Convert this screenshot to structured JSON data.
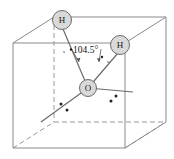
{
  "figure": {
    "colors": {
      "atom_fill": "#d9d9d9",
      "atom_stroke": "#6b6b6b",
      "bond": "#6b6b6b",
      "cube_solid": "#8a8a8a",
      "cube_dashed": "#9a9a9a",
      "dot": "#222222",
      "background": "#ffffff"
    }
  },
  "atoms": [
    {
      "id": "h-top",
      "label": "H",
      "cx": 62,
      "cy": 20,
      "r": 9.5
    },
    {
      "id": "h-right",
      "label": "H",
      "cx": 120,
      "cy": 45,
      "r": 9.5
    },
    {
      "id": "oxygen",
      "label": "O",
      "cx": 88,
      "cy": 88,
      "r": 8.5
    }
  ],
  "angle": {
    "value": "104.5",
    "unit": "°",
    "text": "104.5°",
    "x": 72,
    "y": 52
  },
  "markers": {
    "x_left": "x",
    "x_right": "x"
  },
  "lone_pairs": [
    {
      "cx": 61,
      "cy": 104
    },
    {
      "cx": 67,
      "cy": 110
    },
    {
      "cx": 111,
      "cy": 101
    },
    {
      "cx": 116,
      "cy": 97
    }
  ],
  "angle_arc_dots": [
    {
      "cx": 73,
      "cy": 49
    },
    {
      "cx": 102,
      "cy": 58
    }
  ],
  "cube": {
    "front_top_left": {
      "x": 13,
      "y": 43
    },
    "front_top_right": {
      "x": 125,
      "y": 43
    },
    "front_bot_left": {
      "x": 13,
      "y": 148
    },
    "front_bot_right": {
      "x": 125,
      "y": 148
    },
    "back_top_left": {
      "x": 54,
      "y": 17
    },
    "back_top_right": {
      "x": 166,
      "y": 17
    },
    "back_bot_left": {
      "x": 54,
      "y": 122
    },
    "back_bot_right": {
      "x": 166,
      "y": 122
    }
  }
}
